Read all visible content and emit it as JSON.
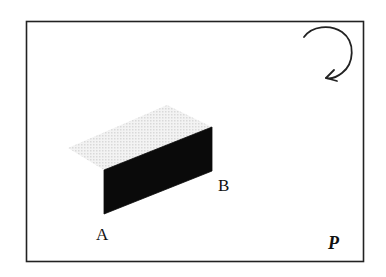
{
  "diagram": {
    "frame_label": "P",
    "point_labels": {
      "a": "A",
      "b": "B"
    },
    "colors": {
      "frame": "#222222",
      "front_face": "#0a0a0a",
      "top_face": "#e6e6e6",
      "arrow": "#222222"
    },
    "icons": {
      "rotation": "clockwise-rotation-arrow"
    }
  }
}
